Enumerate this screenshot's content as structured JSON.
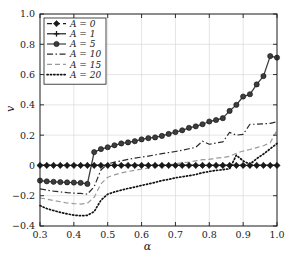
{
  "chart_data": {
    "type": "line",
    "title": "",
    "xlabel": "α",
    "ylabel": "v",
    "xlim": [
      0.3,
      1.0
    ],
    "ylim": [
      -0.4,
      1.0
    ],
    "xticks": [
      0.3,
      0.4,
      0.5,
      0.6,
      0.7,
      0.8,
      0.9,
      1.0
    ],
    "xtick_labels": [
      "0.3",
      "0.4",
      "0.5",
      "0.6",
      "0.7",
      "0.8",
      "0.9",
      "1.0"
    ],
    "yticks": [
      -0.4,
      -0.2,
      0.0,
      0.2,
      0.4,
      0.6,
      0.8,
      1.0
    ],
    "ytick_labels": [
      "-0.4",
      "-0.2",
      "0",
      "0.2",
      "0.4",
      "0.6",
      "0.8",
      "1.0"
    ],
    "grid": true,
    "legend_position": "upper left",
    "x": [
      0.3,
      0.32,
      0.34,
      0.36,
      0.38,
      0.4,
      0.42,
      0.44,
      0.46,
      0.48,
      0.5,
      0.52,
      0.54,
      0.56,
      0.58,
      0.6,
      0.62,
      0.64,
      0.66,
      0.68,
      0.7,
      0.72,
      0.74,
      0.76,
      0.78,
      0.8,
      0.82,
      0.84,
      0.86,
      0.88,
      0.9,
      0.92,
      0.94,
      0.96,
      0.98,
      1.0
    ],
    "series": [
      {
        "name": "A = 0",
        "legend_label": "A = 0",
        "color": "#1a1a1a",
        "linestyle": "dashed",
        "marker": "diamond",
        "values": [
          0,
          0,
          0,
          0,
          0,
          0,
          0,
          0,
          0,
          0,
          0,
          0,
          0,
          0,
          0,
          0,
          0,
          0,
          0,
          0,
          0,
          0,
          0,
          0,
          0,
          0,
          0,
          0,
          0,
          0,
          0,
          0,
          0,
          0,
          0,
          0
        ]
      },
      {
        "name": "A = 1",
        "legend_label": "A = 1",
        "color": "#1a1a1a",
        "linestyle": "solid",
        "marker": "plus",
        "values": [
          0,
          0,
          0,
          0,
          0,
          0,
          0,
          0,
          0,
          0,
          0,
          0,
          0,
          0,
          0,
          0,
          0,
          0,
          0,
          0,
          0,
          0,
          0,
          0,
          0,
          0,
          0,
          0,
          0,
          0,
          0,
          0,
          0,
          0,
          0,
          0
        ]
      },
      {
        "name": "A = 5",
        "legend_label": "A = 5",
        "color": "#3d3d3d",
        "linestyle": "solid",
        "marker": "circle",
        "values": [
          -0.1,
          -0.105,
          -0.108,
          -0.11,
          -0.112,
          -0.113,
          -0.115,
          -0.122,
          0.088,
          0.108,
          0.12,
          0.133,
          0.145,
          0.152,
          0.16,
          0.172,
          0.18,
          0.185,
          0.195,
          0.208,
          0.22,
          0.232,
          0.248,
          0.258,
          0.272,
          0.29,
          0.3,
          0.312,
          0.36,
          0.4,
          0.455,
          0.47,
          0.535,
          0.59,
          0.722,
          0.712
        ]
      },
      {
        "name": "A = 10",
        "legend_label": "A = 10",
        "color": "#2b2b2b",
        "linestyle": "dashdot",
        "marker": "none",
        "values": [
          -0.155,
          -0.163,
          -0.17,
          -0.175,
          -0.18,
          -0.183,
          -0.185,
          -0.19,
          -0.14,
          -0.03,
          0.01,
          0.022,
          0.03,
          0.04,
          0.048,
          0.055,
          0.062,
          0.07,
          0.078,
          0.085,
          0.092,
          0.1,
          0.11,
          0.12,
          0.16,
          0.14,
          0.148,
          0.155,
          0.218,
          0.2,
          0.205,
          0.272,
          0.272,
          0.275,
          0.278,
          0.288
        ]
      },
      {
        "name": "A = 15",
        "legend_label": "A = 15",
        "color": "#9a9a9a",
        "linestyle": "dashed",
        "marker": "none",
        "values": [
          -0.215,
          -0.222,
          -0.232,
          -0.24,
          -0.248,
          -0.252,
          -0.255,
          -0.25,
          -0.21,
          -0.122,
          -0.078,
          -0.062,
          -0.05,
          -0.04,
          -0.032,
          -0.025,
          -0.018,
          -0.01,
          -0.003,
          0.003,
          0.01,
          0.018,
          0.022,
          0.03,
          0.038,
          0.04,
          0.048,
          0.052,
          0.06,
          0.08,
          0.095,
          0.105,
          0.118,
          0.13,
          0.15,
          0.232
        ]
      },
      {
        "name": "A = 20",
        "legend_label": "A = 20",
        "color": "#111111",
        "linestyle": "dotted",
        "marker": "none",
        "values": [
          -0.265,
          -0.285,
          -0.298,
          -0.31,
          -0.32,
          -0.328,
          -0.332,
          -0.33,
          -0.305,
          -0.23,
          -0.19,
          -0.175,
          -0.163,
          -0.152,
          -0.143,
          -0.132,
          -0.122,
          -0.112,
          -0.1,
          -0.092,
          -0.082,
          -0.075,
          -0.068,
          -0.06,
          -0.048,
          -0.04,
          -0.033,
          -0.028,
          -0.022,
          0.068,
          0.03,
          0.008,
          0.045,
          0.075,
          0.11,
          0.145
        ]
      }
    ]
  }
}
